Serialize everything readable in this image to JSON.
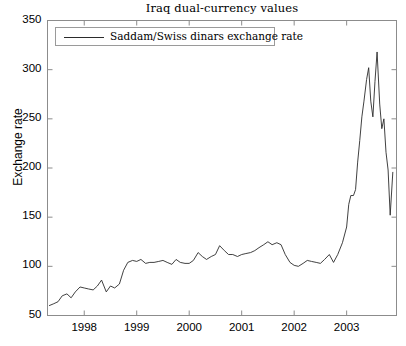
{
  "chart_data": {
    "type": "line",
    "title": "Iraq dual-currency values",
    "xlabel": "",
    "ylabel": "Exchange rate",
    "xlim": [
      1997.3,
      2003.95
    ],
    "ylim": [
      50,
      350
    ],
    "yticks": [
      50,
      100,
      150,
      200,
      250,
      300,
      350
    ],
    "xticks": [
      1998,
      1999,
      2000,
      2001,
      2002,
      2003
    ],
    "grid": false,
    "legend_position": "top-left",
    "series": [
      {
        "name": "Saddam/Swiss dinars exchange rate",
        "color": "#2b2b2b",
        "x": [
          1997.33,
          1997.42,
          1997.5,
          1997.58,
          1997.67,
          1997.75,
          1997.83,
          1997.92,
          1998.0,
          1998.08,
          1998.17,
          1998.25,
          1998.33,
          1998.42,
          1998.5,
          1998.58,
          1998.67,
          1998.75,
          1998.83,
          1998.92,
          1999.0,
          1999.08,
          1999.17,
          1999.25,
          1999.33,
          1999.42,
          1999.5,
          1999.58,
          1999.67,
          1999.75,
          1999.83,
          1999.92,
          2000.0,
          2000.08,
          2000.17,
          2000.25,
          2000.33,
          2000.42,
          2000.5,
          2000.58,
          2000.67,
          2000.75,
          2000.83,
          2000.92,
          2001.0,
          2001.08,
          2001.17,
          2001.25,
          2001.33,
          2001.42,
          2001.5,
          2001.58,
          2001.67,
          2001.75,
          2001.83,
          2001.92,
          2002.0,
          2002.08,
          2002.17,
          2002.25,
          2002.33,
          2002.42,
          2002.5,
          2002.58,
          2002.67,
          2002.75,
          2002.83,
          2002.92,
          2003.0,
          2003.04,
          2003.08,
          2003.13,
          2003.17,
          2003.21,
          2003.25,
          2003.29,
          2003.33,
          2003.38,
          2003.42,
          2003.46,
          2003.5,
          2003.54,
          2003.58,
          2003.63,
          2003.67,
          2003.71,
          2003.75,
          2003.79,
          2003.83,
          2003.88
        ],
        "y": [
          60,
          62,
          64,
          70,
          72,
          68,
          74,
          79,
          78,
          77,
          76,
          80,
          86,
          74,
          80,
          78,
          82,
          96,
          104,
          106,
          105,
          107,
          103,
          104,
          104,
          105,
          106,
          104,
          102,
          107,
          104,
          103,
          103,
          106,
          114,
          110,
          107,
          110,
          112,
          121,
          116,
          112,
          112,
          110,
          112,
          113,
          114,
          116,
          119,
          122,
          125,
          122,
          124,
          122,
          112,
          104,
          101,
          100,
          103,
          106,
          105,
          104,
          103,
          107,
          112,
          104,
          112,
          124,
          140,
          163,
          172,
          172,
          178,
          206,
          228,
          252,
          268,
          290,
          302,
          268,
          252,
          288,
          318,
          265,
          240,
          250,
          216,
          198,
          152,
          196
        ]
      }
    ]
  },
  "axes": {
    "ytick_labels": [
      "350",
      "300",
      "250",
      "200",
      "150",
      "100",
      "50"
    ],
    "xtick_labels": [
      "1998",
      "1999",
      "2000",
      "2001",
      "2002",
      "2003"
    ]
  },
  "legend": {
    "label": "Saddam/Swiss dinars exchange rate"
  }
}
